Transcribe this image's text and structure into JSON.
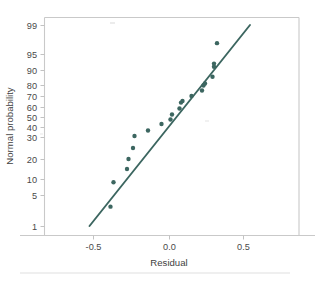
{
  "figure": {
    "background": "#ffffff",
    "accent_color": "#3c6660",
    "axis_color": "#c9c9c9",
    "text_color": "#4a4a4a"
  },
  "axes": {
    "xlabel": "Residual",
    "ylabel": "Normal probability",
    "x_ticks": [
      {
        "label": "-0.5",
        "value": -0.5,
        "px": 93
      },
      {
        "label": "0.0",
        "value": 0.0,
        "px": 169
      },
      {
        "label": "0.5",
        "value": 0.5,
        "px": 243
      }
    ],
    "y_ticks": [
      {
        "label": "99",
        "value": 99,
        "px": 25
      },
      {
        "label": "95",
        "value": 95,
        "px": 54
      },
      {
        "label": "90",
        "value": 90,
        "px": 70
      },
      {
        "label": "80",
        "value": 80,
        "px": 85
      },
      {
        "label": "70",
        "value": 70,
        "px": 96
      },
      {
        "label": "60",
        "value": 60,
        "px": 107
      },
      {
        "label": "50",
        "value": 50,
        "px": 117
      },
      {
        "label": "40",
        "value": 40,
        "px": 127
      },
      {
        "label": "30",
        "value": 30,
        "px": 137
      },
      {
        "label": "20",
        "value": 20,
        "px": 159
      },
      {
        "label": "10",
        "value": 10,
        "px": 179
      },
      {
        "label": "5",
        "value": 5,
        "px": 195
      },
      {
        "label": "1",
        "value": 1,
        "px": 226
      }
    ]
  },
  "chart_data": {
    "type": "scatter",
    "title": "",
    "subtitle": "",
    "xlabel": "Residual",
    "ylabel": "Normal probability",
    "xlim": [
      -0.84,
      0.85
    ],
    "ylim": [
      0.55,
      99.6
    ],
    "y_scale": "normal-probability",
    "grid": false,
    "legend": null,
    "series": [
      {
        "name": "residual quantiles",
        "marker": "filled-circle",
        "color": "#3c6660",
        "points": [
          {
            "x": -0.39,
            "y": 3.5
          },
          {
            "x": -0.37,
            "y": 9.0
          },
          {
            "x": -0.28,
            "y": 15.0
          },
          {
            "x": -0.27,
            "y": 20.0
          },
          {
            "x": -0.24,
            "y": 25.0
          },
          {
            "x": -0.23,
            "y": 31.0
          },
          {
            "x": -0.14,
            "y": 36.5
          },
          {
            "x": -0.05,
            "y": 43.0
          },
          {
            "x": 0.01,
            "y": 47.5
          },
          {
            "x": 0.02,
            "y": 52.5
          },
          {
            "x": 0.07,
            "y": 58.5
          },
          {
            "x": 0.08,
            "y": 64.0
          },
          {
            "x": 0.09,
            "y": 65.5
          },
          {
            "x": 0.15,
            "y": 70.0
          },
          {
            "x": 0.22,
            "y": 75.0
          },
          {
            "x": 0.23,
            "y": 79.5
          },
          {
            "x": 0.24,
            "y": 81.0
          },
          {
            "x": 0.29,
            "y": 85.5
          },
          {
            "x": 0.3,
            "y": 91.0
          },
          {
            "x": 0.3,
            "y": 92.0
          },
          {
            "x": 0.32,
            "y": 96.5
          }
        ]
      }
    ],
    "reference_line": {
      "name": "normal reference line",
      "color": "#3c6660",
      "start": {
        "x": -0.53,
        "y": 1.0
      },
      "end": {
        "x": 0.54,
        "y": 99.0
      }
    }
  }
}
